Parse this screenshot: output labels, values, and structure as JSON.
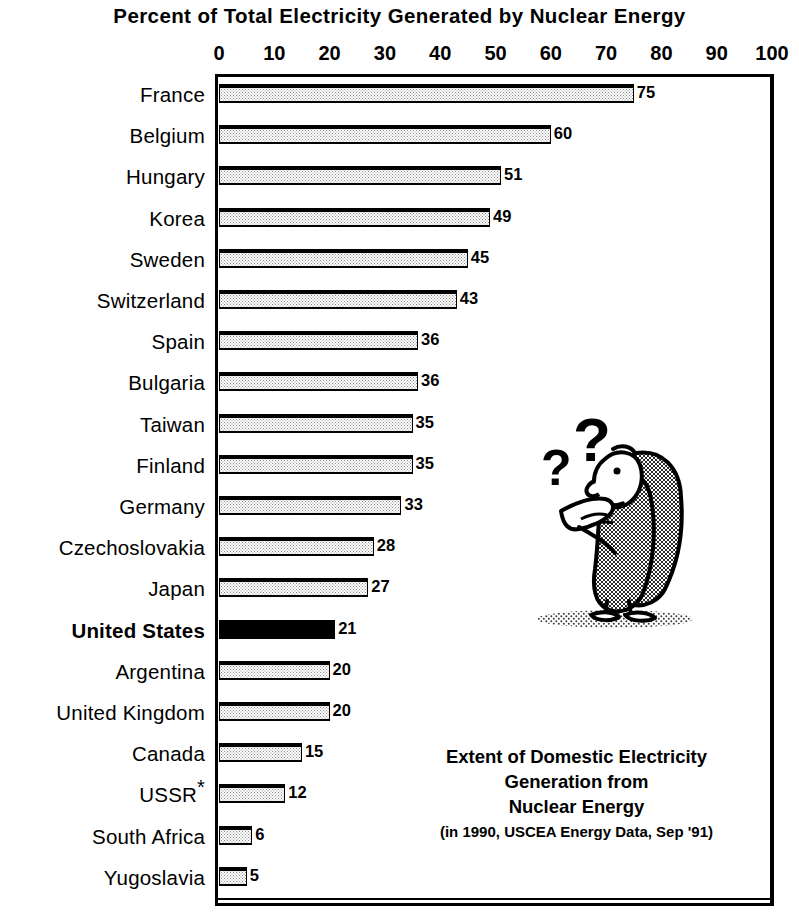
{
  "chart_data": {
    "type": "bar",
    "orientation": "horizontal",
    "title": "Percent of Total Electricity Generated by Nuclear Energy",
    "xlabel": "",
    "ylabel": "",
    "xlim": [
      0,
      100
    ],
    "xticks": [
      0,
      10,
      20,
      30,
      40,
      50,
      60,
      70,
      80,
      90,
      100
    ],
    "grid": false,
    "legend": "none",
    "categories": [
      "France",
      "Belgium",
      "Hungary",
      "Korea",
      "Sweden",
      "Switzerland",
      "Spain",
      "Bulgaria",
      "Taiwan",
      "Finland",
      "Germany",
      "Czechoslovakia",
      "Japan",
      "United States",
      "Argentina",
      "United Kingdom",
      "Canada",
      "USSR*",
      "South Africa",
      "Yugoslavia"
    ],
    "values": [
      75,
      60,
      51,
      49,
      45,
      43,
      36,
      36,
      35,
      35,
      33,
      28,
      27,
      21,
      20,
      20,
      15,
      12,
      6,
      5
    ],
    "highlight_category": "United States",
    "highlight_color": "#000000",
    "bar_fill_color": "#e8e8e8",
    "bar_edge_color": "#000000"
  },
  "rows": [
    {
      "label": "France",
      "value": 75,
      "value_text": "75",
      "bold": false,
      "solid": false,
      "star": ""
    },
    {
      "label": "Belgium",
      "value": 60,
      "value_text": "60",
      "bold": false,
      "solid": false,
      "star": ""
    },
    {
      "label": "Hungary",
      "value": 51,
      "value_text": "51",
      "bold": false,
      "solid": false,
      "star": ""
    },
    {
      "label": "Korea",
      "value": 49,
      "value_text": "49",
      "bold": false,
      "solid": false,
      "star": ""
    },
    {
      "label": "Sweden",
      "value": 45,
      "value_text": "45",
      "bold": false,
      "solid": false,
      "star": ""
    },
    {
      "label": "Switzerland",
      "value": 43,
      "value_text": "43",
      "bold": false,
      "solid": false,
      "star": ""
    },
    {
      "label": "Spain",
      "value": 36,
      "value_text": "36",
      "bold": false,
      "solid": false,
      "star": ""
    },
    {
      "label": "Bulgaria",
      "value": 36,
      "value_text": "36",
      "bold": false,
      "solid": false,
      "star": ""
    },
    {
      "label": "Taiwan",
      "value": 35,
      "value_text": "35",
      "bold": false,
      "solid": false,
      "star": ""
    },
    {
      "label": "Finland",
      "value": 35,
      "value_text": "35",
      "bold": false,
      "solid": false,
      "star": ""
    },
    {
      "label": "Germany",
      "value": 33,
      "value_text": "33",
      "bold": false,
      "solid": false,
      "star": ""
    },
    {
      "label": "Czechoslovakia",
      "value": 28,
      "value_text": "28",
      "bold": false,
      "solid": false,
      "star": ""
    },
    {
      "label": "Japan",
      "value": 27,
      "value_text": "27",
      "bold": false,
      "solid": false,
      "star": ""
    },
    {
      "label": "United States",
      "value": 21,
      "value_text": "21",
      "bold": true,
      "solid": true,
      "star": ""
    },
    {
      "label": "Argentina",
      "value": 20,
      "value_text": "20",
      "bold": false,
      "solid": false,
      "star": ""
    },
    {
      "label": "United Kingdom",
      "value": 20,
      "value_text": "20",
      "bold": false,
      "solid": false,
      "star": ""
    },
    {
      "label": "Canada",
      "value": 15,
      "value_text": "15",
      "bold": false,
      "solid": false,
      "star": ""
    },
    {
      "label": "USSR",
      "value": 12,
      "value_text": "12",
      "bold": false,
      "solid": false,
      "star": "*"
    },
    {
      "label": "South Africa",
      "value": 6,
      "value_text": "6",
      "bold": false,
      "solid": false,
      "star": ""
    },
    {
      "label": "Yugoslavia",
      "value": 5,
      "value_text": "5",
      "bold": false,
      "solid": false,
      "star": ""
    }
  ],
  "axis": {
    "ticks": [
      "0",
      "10",
      "20",
      "30",
      "40",
      "50",
      "60",
      "70",
      "80",
      "90",
      "100"
    ]
  },
  "caption": {
    "line1": "Extent of Domestic Electricity",
    "line2": "Generation from",
    "line3": "Nuclear Energy",
    "source": "(in 1990, USCEA Energy Data, Sep '91)"
  },
  "cartoon": {
    "alt": "puzzled figure with question marks",
    "question_mark_small": "?",
    "question_mark_large": "?"
  }
}
